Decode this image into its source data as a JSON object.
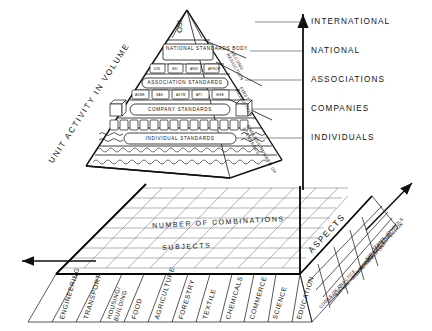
{
  "diagram": {
    "axes": {
      "vertical_label": "UNIT ACTIVITY IN VOLUME",
      "vertical_levels": [
        "INTERNATIONAL",
        "NATIONAL",
        "ASSOCIATIONS",
        "COMPANIES",
        "INDIVIDUALS"
      ],
      "depth_label": "SUBJECTS",
      "aspects_label": "ASPECTS",
      "grid_label": "NUMBER OF COMBINATIONS"
    },
    "pyramid": {
      "apex": "ISO",
      "levels": [
        "NATIONAL STANDARDS BODY",
        "ASSOCIATION STANDARDS",
        "COMPANY STANDARDS",
        "INDIVIDUAL STANDARDS"
      ],
      "member_bodies": [
        "ISO",
        "DIN",
        "BSI",
        "ANSI",
        "AFNOR",
        "SAA"
      ],
      "association_tags": [
        "ASME",
        "SAE",
        "ASTM",
        "API",
        "IEEE",
        "DIN"
      ],
      "reductions": [
        "SECOND\nREDUCTION",
        "FIRST\nREDUCTION",
        "ENDLESS NUMBER OF\nSTANDARDS"
      ]
    },
    "subjects": [
      "ENGINEERING",
      "TRANSPORT",
      "HOUSING/\nBUILDING",
      "FOOD",
      "AGRICULTURE",
      "FORESTRY",
      "TEXTILE",
      "CHEMICALS",
      "COMMERCE",
      "SCIENCE",
      "EDUCATION"
    ],
    "aspects": [
      "TERMS, SYMBOLS",
      "SPECIFICATION",
      "TESTING AND\nINSPECTION",
      "DIMENSIONS",
      "PACKAGING,\nTRANSPORT",
      "SAFETY",
      "QUALITY",
      "CODES OF\nPRACTICE"
    ],
    "colors": {
      "ink": "#111111",
      "background": "#ffffff",
      "grid_line": "#555555",
      "heavy_line": "#000000"
    }
  }
}
